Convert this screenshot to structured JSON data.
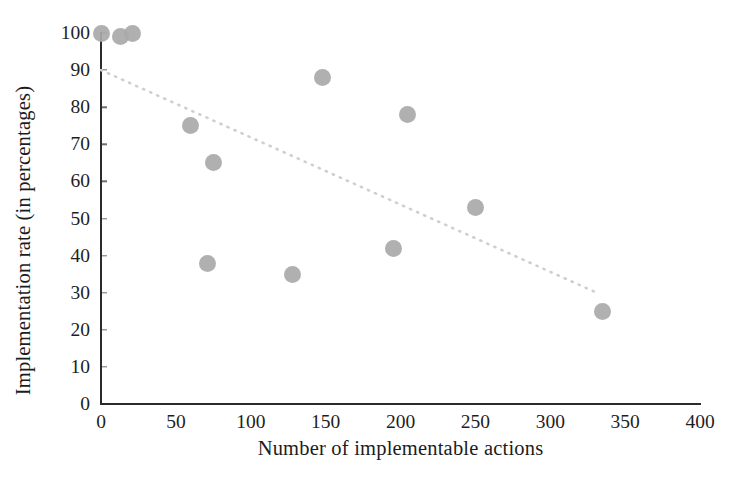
{
  "chart_data": {
    "type": "scatter",
    "title": "",
    "xlabel": "Number of implementable actions",
    "ylabel": "Implementation rate (in percentages)",
    "xlim": [
      0,
      400
    ],
    "ylim": [
      0,
      100
    ],
    "xticks": [
      "0",
      "50",
      "100",
      "150",
      "200",
      "250",
      "300",
      "350",
      "400"
    ],
    "yticks": [
      "0",
      "10",
      "20",
      "30",
      "40",
      "50",
      "60",
      "70",
      "80",
      "90",
      "100"
    ],
    "grid": false,
    "legend": "none",
    "marker_color": "#a9a9a9",
    "trendline_color": "#cfcfcf",
    "axis_color": "#2b2b2b",
    "points": [
      {
        "x": 0,
        "y": 100
      },
      {
        "x": 13,
        "y": 99
      },
      {
        "x": 21,
        "y": 100
      },
      {
        "x": 60,
        "y": 75
      },
      {
        "x": 75,
        "y": 65
      },
      {
        "x": 71,
        "y": 38
      },
      {
        "x": 128,
        "y": 35
      },
      {
        "x": 148,
        "y": 88
      },
      {
        "x": 195,
        "y": 42
      },
      {
        "x": 205,
        "y": 78
      },
      {
        "x": 250,
        "y": 53
      },
      {
        "x": 335,
        "y": 25
      }
    ],
    "trendline": {
      "style": "dotted",
      "x0": 0,
      "y0": 90,
      "x1": 331,
      "y1": 30
    }
  }
}
